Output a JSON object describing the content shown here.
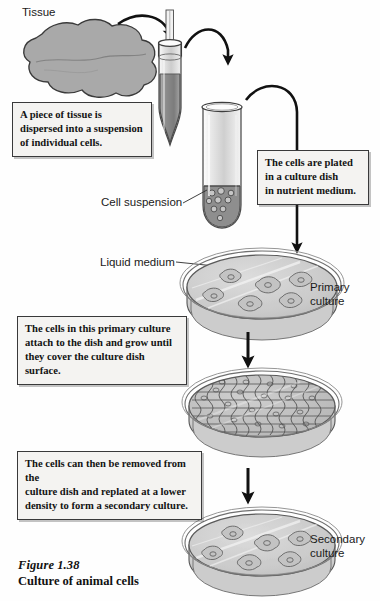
{
  "figure": {
    "number": "Figure 1.38",
    "title": "Culture of animal cells",
    "domain": "cell-biology-diagram"
  },
  "labels": {
    "tissue": "Tissue",
    "cell_suspension": "Cell suspension",
    "liquid_medium": "Liquid medium",
    "primary_culture": "Primary culture",
    "secondary_culture": "Secondary culture"
  },
  "captions": [
    {
      "id": "caption-dispersal",
      "lines": [
        "A piece of tissue is",
        "dispersed into a suspension",
        "of individual cells."
      ]
    },
    {
      "id": "caption-plating",
      "lines": [
        "The cells are plated",
        "in a culture dish",
        "in nutrient medium."
      ]
    },
    {
      "id": "caption-attach-grow",
      "lines": [
        "The cells in this primary culture",
        "attach to the dish and grow until",
        "they cover the culture dish surface."
      ]
    },
    {
      "id": "caption-replate",
      "lines": [
        "The cells can then be removed from the",
        "culture dish and replated at a lower",
        "density to form a secondary culture."
      ]
    }
  ],
  "stages": [
    {
      "id": "tissue-blob",
      "name": "Tissue",
      "cells": 0
    },
    {
      "id": "homogenizer-tube",
      "name": "Homogenizer tube",
      "cells": 0
    },
    {
      "id": "suspension-tube",
      "name": "Cell suspension tube",
      "cells": 9
    },
    {
      "id": "primary-dish",
      "name": "Primary culture",
      "cells": 6
    },
    {
      "id": "confluent-dish",
      "name": "Confluent culture",
      "cells": 0
    },
    {
      "id": "secondary-dish",
      "name": "Secondary culture",
      "cells": 6
    }
  ],
  "arrows": [
    {
      "id": "arrow-tissue-to-tube",
      "style": "curved"
    },
    {
      "id": "arrow-tube-to-tube",
      "style": "curved"
    },
    {
      "id": "arrow-tube-to-dish",
      "style": "curved-long"
    },
    {
      "id": "arrow-primary-to-confluent",
      "style": "straight"
    },
    {
      "id": "arrow-confluent-to-secondary",
      "style": "straight"
    }
  ],
  "colors": {
    "background": "#fefefe",
    "ink": "#1a1a1a",
    "tissue_fill": "#a9a9a9",
    "tissue_stroke": "#3a3a3a",
    "tube_glass": "#d9d9d9",
    "tube_contents": "#8f8f8f",
    "medium_fill": "#cdcdcd",
    "dish_rim": "#efefef",
    "dish_side": "#c4c4c4",
    "cell_fill": "#c8c8c8",
    "cell_stroke": "#6e6e6e",
    "caption_bg": "#f4f3f1",
    "caption_border": "#39393a"
  }
}
